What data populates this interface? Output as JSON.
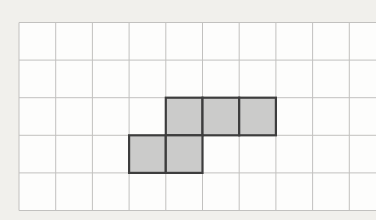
{
  "figure": {
    "width": 376,
    "height": 220,
    "background_color": "#f1f0ec",
    "grid": {
      "left": 19,
      "top": 22.5,
      "cell_width": 36.7,
      "cell_height": 37.6,
      "columns": 10,
      "rows": 5,
      "right_edge_clipped": true,
      "paper_color": "#fdfdfc",
      "line_color": "#c2c1bf",
      "line_width": 1
    },
    "shaded_shape": {
      "cell_count": 5,
      "fill_color": "#cbcbca",
      "border_color": "#3d3d3d",
      "border_width": 2.2,
      "cells": [
        {
          "col": 4,
          "row": 2
        },
        {
          "col": 5,
          "row": 2
        },
        {
          "col": 6,
          "row": 2
        },
        {
          "col": 3,
          "row": 3
        },
        {
          "col": 4,
          "row": 3
        }
      ]
    }
  }
}
